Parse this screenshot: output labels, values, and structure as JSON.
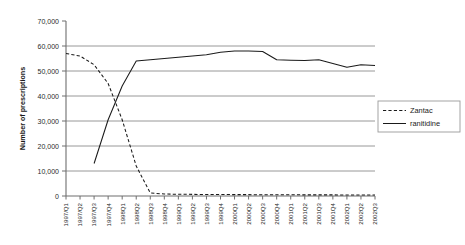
{
  "chart_data": {
    "type": "line",
    "title": "",
    "xlabel": "",
    "ylabel": "Number of prescriptions",
    "ylim": [
      0,
      70000
    ],
    "ytick_step": 10000,
    "ytick_labels": [
      "0",
      "10,000",
      "20,000",
      "30,000",
      "40,000",
      "50,000",
      "60,000",
      "70,000"
    ],
    "ytick_values": [
      0,
      10000,
      20000,
      30000,
      40000,
      50000,
      60000,
      70000
    ],
    "grid": "horizontal",
    "legend_position": "right",
    "categories": [
      "1997/Q1",
      "1997/Q2",
      "1997/Q3",
      "1997/Q4",
      "1998Q1",
      "1998Q2",
      "1998Q3",
      "1998Q4",
      "1999Q1",
      "1999Q2",
      "1999Q3",
      "1999Q4",
      "2000Q1",
      "2000Q2",
      "2000Q3",
      "2000Q4",
      "2001Q1",
      "2001Q2",
      "2001Q3",
      "2001Q4",
      "2002Q1",
      "2002Q2",
      "2002Q3"
    ],
    "series": [
      {
        "name": "Zantac",
        "style": "dashed",
        "color": "#1a1a1a",
        "values": [
          57000,
          56000,
          52500,
          45000,
          30500,
          12000,
          1200,
          800,
          700,
          650,
          600,
          600,
          550,
          550,
          500,
          500,
          500,
          450,
          450,
          450,
          400,
          400,
          400
        ]
      },
      {
        "name": "ranitidine",
        "style": "solid",
        "color": "#1a1a1a",
        "values": [
          null,
          null,
          13000,
          30500,
          44000,
          54000,
          54500,
          55000,
          55500,
          56000,
          56500,
          57500,
          58000,
          58000,
          57800,
          54500,
          54300,
          54200,
          54500,
          53000,
          51500,
          52500,
          52200
        ]
      }
    ]
  },
  "legend": {
    "items": [
      {
        "label": "Zantac",
        "style": "dashed"
      },
      {
        "label": "ranitidine",
        "style": "solid"
      }
    ]
  }
}
